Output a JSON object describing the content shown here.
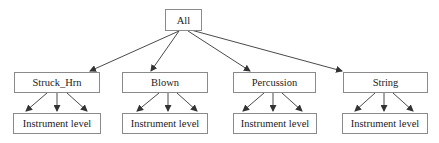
{
  "diagram": {
    "root": {
      "label": "All"
    },
    "categories": [
      {
        "label": "Struck_Hrn",
        "child": "Instrument level"
      },
      {
        "label": "Blown",
        "child": "Instrument level"
      },
      {
        "label": "Percussion",
        "child": "Instrument level"
      },
      {
        "label": "String",
        "child": "Instrument level"
      }
    ]
  }
}
